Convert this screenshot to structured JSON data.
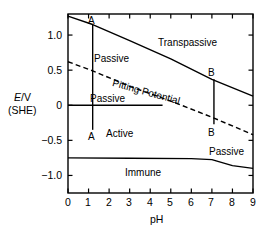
{
  "chart_data": {
    "type": "line",
    "title": "",
    "xlabel": "pH",
    "ylabel": "E/V (SHE)",
    "ylabel_line1": "E/V",
    "ylabel_line2": "(SHE)",
    "xlim": [
      0,
      9
    ],
    "ylim": [
      -1.25,
      1.3
    ],
    "xticks": [
      0,
      1,
      2,
      3,
      4,
      5,
      6,
      7,
      8,
      9
    ],
    "xticklabels": [
      "0",
      "1",
      "2",
      "3",
      "4",
      "5",
      "6",
      "7",
      "8",
      "9"
    ],
    "yticks": [
      1.0,
      0.5,
      0,
      -0.5,
      -1.0
    ],
    "yticklabels": [
      "1.0",
      "0.5",
      "0",
      "−0.5",
      "−1.0"
    ],
    "grid": false,
    "legend": "none",
    "ticks_all_sides": true,
    "line_color": "#000000",
    "series": [
      {
        "name": "Transpassive boundary",
        "style": "solid",
        "points": [
          [
            0,
            1.27
          ],
          [
            1.2,
            1.15
          ],
          [
            3.0,
            0.92
          ],
          [
            5.0,
            0.66
          ],
          [
            7.0,
            0.37
          ],
          [
            9,
            0.13
          ]
        ]
      },
      {
        "name": "Pitting Potential",
        "style": "dashed",
        "label": "Pitting Potential",
        "points": [
          [
            0,
            0.62
          ],
          [
            1.2,
            0.49
          ],
          [
            3.0,
            0.27
          ],
          [
            5.0,
            0.06
          ],
          [
            7.0,
            -0.17
          ],
          [
            9,
            -0.42
          ]
        ]
      },
      {
        "name": "Passive/Active boundary at E=0",
        "style": "solid",
        "points": [
          [
            0,
            0.0
          ],
          [
            4.6,
            0.0
          ]
        ]
      },
      {
        "name": "Immune boundary",
        "style": "solid",
        "points": [
          [
            0,
            -0.75
          ],
          [
            3.0,
            -0.755
          ],
          [
            6.0,
            -0.76
          ],
          [
            7.0,
            -0.775
          ],
          [
            8.0,
            -0.86
          ],
          [
            9,
            -0.9
          ]
        ]
      },
      {
        "name": "Vertical line A",
        "style": "solid",
        "points": [
          [
            1.2,
            1.15
          ],
          [
            1.2,
            -0.35
          ]
        ]
      },
      {
        "name": "Vertical line B",
        "style": "solid",
        "points": [
          [
            7.1,
            0.37
          ],
          [
            7.1,
            -0.27
          ]
        ]
      }
    ],
    "annotations": [
      {
        "name": "transpassive",
        "text": "Transpassive",
        "x": 6.0,
        "y": 0.97
      },
      {
        "name": "passive-upper",
        "text": "Passive",
        "x": 2.2,
        "y": 0.75
      },
      {
        "name": "passive-mid",
        "text": "Passive",
        "x": 2.0,
        "y": 0.17
      },
      {
        "name": "active",
        "text": "Active",
        "x": 2.6,
        "y": -0.33
      },
      {
        "name": "passive-lower-right",
        "text": "Passive",
        "x": 7.6,
        "y": -0.58
      },
      {
        "name": "immune",
        "text": "Immune",
        "x": 3.6,
        "y": -0.95
      },
      {
        "name": "pitting-potential",
        "text": "Pitting Potential",
        "x": 3.4,
        "y": 0.3,
        "rotated": true
      },
      {
        "name": "point-a-top",
        "text": "A",
        "x": 1.2,
        "y": 1.22
      },
      {
        "name": "point-a-bottom",
        "text": "A",
        "x": 1.2,
        "y": -0.45
      },
      {
        "name": "point-b-top",
        "text": "B",
        "x": 7.1,
        "y": 0.47
      },
      {
        "name": "point-b-bottom",
        "text": "B",
        "x": 7.1,
        "y": -0.38
      }
    ]
  },
  "axes": {
    "x_title": "pH",
    "y_title_line1": "E/V",
    "y_title_line1_italic": "E",
    "y_title_line1_rest": "/V",
    "y_title_line2": "(SHE)"
  },
  "tick_labels": {
    "y": [
      "1.0",
      "0.5",
      "0",
      "−0.5",
      "−1.0"
    ],
    "x": [
      "0",
      "1",
      "2",
      "3",
      "4",
      "5",
      "6",
      "7",
      "8",
      "9"
    ]
  },
  "regions": {
    "transpassive": "Transpassive",
    "passive_upper": "Passive",
    "passive_mid": "Passive",
    "passive_lower": "Passive",
    "active": "Active",
    "immune": "Immune"
  },
  "curves": {
    "pitting_potential_label": "Pitting Potential"
  },
  "markers": {
    "a_top": "A",
    "a_bottom": "A",
    "b_top": "B",
    "b_bottom": "B"
  }
}
